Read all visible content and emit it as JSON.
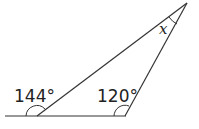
{
  "diagram": {
    "type": "triangle-exterior-angle",
    "line_color": "#333333",
    "labels": {
      "exterior_angle": "144°",
      "interior_angle_right": "120°",
      "unknown_angle": "x"
    }
  }
}
